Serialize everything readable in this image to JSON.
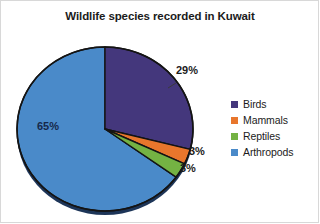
{
  "chart_data": {
    "type": "pie",
    "title": "Wildlife species recorded in Kuwait",
    "xlabel": "",
    "ylabel": "",
    "grid": false,
    "legend_position": "right",
    "start_angle_deg": 0,
    "direction": "clockwise",
    "categories": [
      "Birds",
      "Mammals",
      "Reptiles",
      "Arthropods"
    ],
    "values": [
      29,
      3,
      3,
      65
    ],
    "value_unit": "%",
    "data_labels": [
      "29%",
      "3%",
      "3%",
      "65%"
    ],
    "colors": [
      "#44377c",
      "#e8762c",
      "#74b243",
      "#4a8ac9"
    ],
    "slices": [
      {
        "label": "Birds",
        "value": 29,
        "data_label": "29%",
        "color": "#44377c",
        "label_position": "outside"
      },
      {
        "label": "Mammals",
        "value": 3,
        "data_label": "3%",
        "color": "#e8762c",
        "label_position": "outside"
      },
      {
        "label": "Reptiles",
        "value": 3,
        "data_label": "3%",
        "color": "#74b243",
        "label_position": "outside"
      },
      {
        "label": "Arthropods",
        "value": 65,
        "data_label": "65%",
        "color": "#4a8ac9",
        "label_position": "inside"
      }
    ]
  },
  "legend": {
    "items": [
      {
        "label": "Birds",
        "color": "#44377c"
      },
      {
        "label": "Mammals",
        "color": "#e8762c"
      },
      {
        "label": "Reptiles",
        "color": "#74b243"
      },
      {
        "label": "Arthropods",
        "color": "#4a8ac9"
      }
    ]
  },
  "labels": {
    "birds_pct": "29%",
    "mammals_pct": "3%",
    "reptiles_pct": "3%",
    "arthropods_pct": "65%"
  },
  "colors": {
    "birds": "#44377c",
    "mammals": "#e8762c",
    "reptiles": "#74b243",
    "arthropods": "#4a8ac9",
    "outline": "#141414",
    "background": "#ffffff",
    "text": "#1b1b1b",
    "inside_label_text": "#16284a"
  }
}
